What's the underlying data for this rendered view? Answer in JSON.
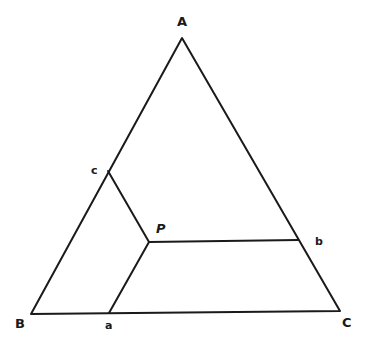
{
  "diagram": {
    "stroke_color": "#1a1a1a",
    "background": "#ffffff",
    "vertices": {
      "A": {
        "label": "A",
        "x": 182,
        "y": 38
      },
      "B": {
        "label": "B",
        "x": 31,
        "y": 314
      },
      "C": {
        "label": "C",
        "x": 340,
        "y": 311
      }
    },
    "points": {
      "P": {
        "label": "P",
        "x": 149,
        "y": 242
      },
      "a": {
        "label": "a",
        "x": 109,
        "y": 313
      },
      "b": {
        "label": "b",
        "x": 298,
        "y": 240
      },
      "c": {
        "label": "c",
        "x": 108,
        "y": 171
      }
    },
    "segments": [
      {
        "from": "A",
        "to": "B"
      },
      {
        "from": "B",
        "to": "C"
      },
      {
        "from": "C",
        "to": "A"
      },
      {
        "from": "P",
        "to": "a"
      },
      {
        "from": "P",
        "to": "b"
      },
      {
        "from": "P",
        "to": "c"
      }
    ]
  }
}
